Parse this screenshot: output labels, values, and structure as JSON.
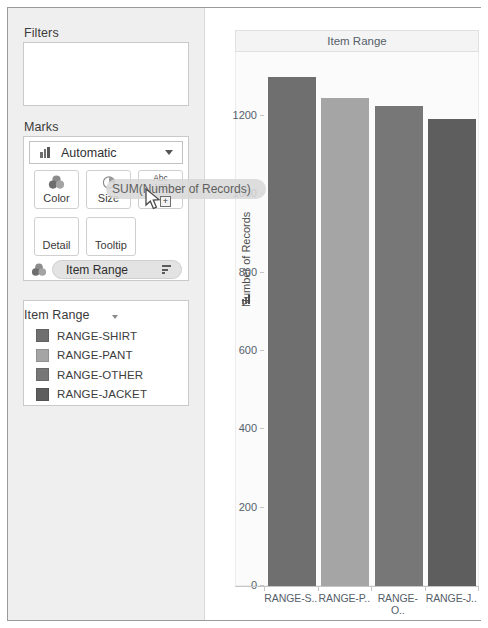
{
  "left_panel": {
    "filters": {
      "title": "Filters"
    },
    "marks": {
      "title": "Marks",
      "mark_type": {
        "label": "Automatic",
        "icon": "bar-chart-icon",
        "caret": "chevron-down-icon"
      },
      "buttons": [
        {
          "label": "Color",
          "icon": "color-circles-icon"
        },
        {
          "label": "Size",
          "icon": "size-pie-icon"
        },
        {
          "label": "",
          "icon": "label-abc123-icon",
          "glyph_top": "Abc",
          "glyph_bottom": "123"
        },
        {
          "label": "Detail",
          "icon": ""
        },
        {
          "label": "Tooltip",
          "icon": ""
        }
      ],
      "color_shelf": {
        "icon": "color-circles-icon",
        "pill_label": "Item Range",
        "sort_icon": "sort-descending-icon"
      }
    },
    "legend": {
      "title": "Item Range",
      "caret": "chevron-down-icon",
      "items": [
        {
          "label": "RANGE-SHIRT",
          "color": "#6f6f6f"
        },
        {
          "label": "RANGE-PANT",
          "color": "#a5a5a5"
        },
        {
          "label": "RANGE-OTHER",
          "color": "#777777"
        },
        {
          "label": "RANGE-JACKET",
          "color": "#5e5e5e"
        }
      ]
    }
  },
  "view": {
    "title": "Item Range"
  },
  "drag_overlay": {
    "pill_label": "SUM(Number of Records)",
    "cursor": "drag-cursor-icon",
    "plus_badge": "+"
  },
  "chart_data": {
    "type": "bar",
    "title": "Item Range",
    "xlabel": "",
    "ylabel": "Number of Records",
    "categories": [
      "RANGE-S..",
      "RANGE-P..",
      "RANGE-O..",
      "RANGE-J.."
    ],
    "category_full": [
      "RANGE-SHIRT",
      "RANGE-PANT",
      "RANGE-OTHER",
      "RANGE-JACKET"
    ],
    "values": [
      1300,
      1246,
      1226,
      1192
    ],
    "colors": [
      "#6f6f6f",
      "#a5a5a5",
      "#777777",
      "#5e5e5e"
    ],
    "ylim": [
      0,
      1300
    ],
    "yticks": [
      0,
      200,
      400,
      600,
      800,
      1000,
      1200
    ],
    "ytick_labels": [
      "0",
      "200",
      "400",
      "600",
      "800",
      "1000",
      "1200"
    ],
    "grid": false,
    "legend": {
      "title": "Item Range",
      "position": "left-panel"
    }
  }
}
